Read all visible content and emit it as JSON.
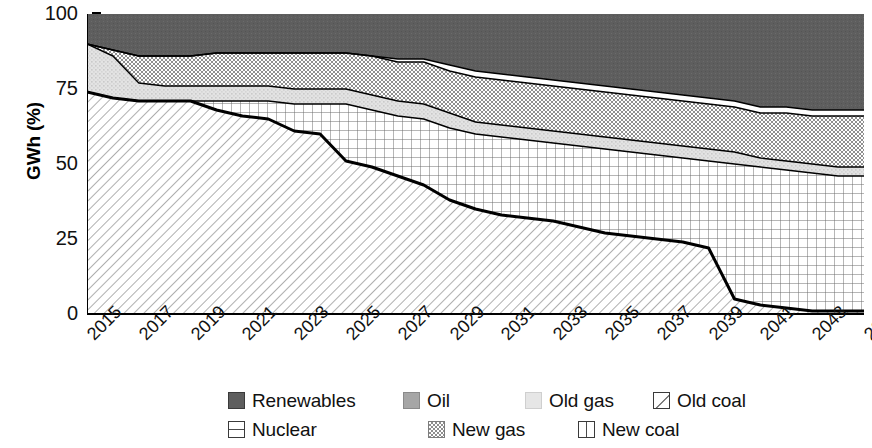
{
  "chart_data": {
    "type": "area",
    "title": "",
    "subtitle": "",
    "xlabel": "",
    "ylabel": "GWh (%)",
    "stacked": true,
    "grid": false,
    "legend_position": "bottom",
    "xlim": [
      2015,
      2045
    ],
    "ylim": [
      0,
      100
    ],
    "yticks": [
      0,
      25,
      50,
      75,
      100
    ],
    "ytick_labels": [
      "0",
      "25",
      "50",
      "75",
      "100"
    ],
    "x": [
      2015,
      2016,
      2017,
      2018,
      2019,
      2020,
      2021,
      2022,
      2023,
      2024,
      2025,
      2026,
      2027,
      2028,
      2029,
      2030,
      2031,
      2032,
      2033,
      2034,
      2035,
      2036,
      2037,
      2038,
      2039,
      2040,
      2041,
      2042,
      2043,
      2044,
      2045
    ],
    "xtick_labels": [
      "2015",
      "2017",
      "2019",
      "2021",
      "2023",
      "2025",
      "2027",
      "2029",
      "2031",
      "2033",
      "2035",
      "2037",
      "2039",
      "2041",
      "2043",
      "2045"
    ],
    "series": [
      {
        "name": "Nuclear",
        "pattern": "diagonal-hatch",
        "color": "#ffffff",
        "values": [
          74,
          72,
          71,
          71,
          71,
          68,
          66,
          65,
          61,
          60,
          51,
          49,
          46,
          43,
          38,
          35,
          33,
          32,
          31,
          29,
          27,
          26,
          25,
          24,
          22,
          5,
          3,
          2,
          1,
          1,
          1
        ]
      },
      {
        "name": "Old coal",
        "pattern": "fine-grid",
        "color": "#ffffff",
        "values": [
          0,
          0,
          0,
          0,
          0,
          3,
          5,
          6,
          9,
          10,
          19,
          19,
          20,
          22,
          24,
          25,
          26,
          26,
          26,
          27,
          28,
          28,
          28,
          28,
          29,
          45,
          46,
          46,
          46,
          45,
          45
        ]
      },
      {
        "name": "Old gas",
        "pattern": "light-stipple",
        "color": "#dcdcdc",
        "values": [
          16,
          14,
          6,
          5,
          5,
          5,
          5,
          5,
          5,
          5,
          5,
          5,
          5,
          5,
          5,
          4,
          4,
          4,
          4,
          4,
          4,
          4,
          4,
          4,
          4,
          4,
          3,
          3,
          3,
          3,
          3
        ]
      },
      {
        "name": "New gas",
        "pattern": "checker",
        "color": "#bdbdbd",
        "values": [
          0,
          2,
          9,
          10,
          10,
          11,
          11,
          11,
          12,
          12,
          12,
          13,
          13,
          14,
          14,
          15,
          15,
          15,
          15,
          15,
          15,
          15,
          15,
          15,
          15,
          15,
          15,
          16,
          16,
          17,
          17
        ]
      },
      {
        "name": "New coal",
        "pattern": "white",
        "color": "#ffffff",
        "values": [
          0,
          0,
          0,
          0,
          0,
          0,
          0,
          0,
          0,
          0,
          0,
          0,
          1,
          1,
          2,
          2,
          2,
          2,
          2,
          2,
          2,
          2,
          2,
          2,
          2,
          2,
          2,
          2,
          2,
          2,
          2
        ]
      },
      {
        "name": "Oil",
        "pattern": "mid-stipple",
        "color": "#9a9a9a",
        "values": [
          0,
          0,
          0,
          0,
          0,
          0,
          0,
          0,
          0,
          0,
          0,
          0,
          0,
          0,
          0,
          0,
          0,
          0,
          0,
          0,
          0,
          0,
          0,
          0,
          0,
          0,
          0,
          0,
          0,
          0,
          0
        ]
      },
      {
        "name": "Renewables",
        "pattern": "dark-solid",
        "color": "#5e5e5e",
        "values": [
          10,
          12,
          14,
          14,
          14,
          13,
          13,
          13,
          13,
          13,
          13,
          14,
          15,
          15,
          17,
          19,
          20,
          21,
          22,
          23,
          24,
          25,
          26,
          27,
          28,
          29,
          31,
          31,
          32,
          32,
          32
        ]
      }
    ],
    "boundaries": {
      "note": "cumulative top edges, percent",
      "nuclear_top": [
        74,
        72,
        71,
        71,
        71,
        68,
        66,
        65,
        61,
        60,
        51,
        49,
        46,
        43,
        38,
        35,
        33,
        32,
        31,
        29,
        27,
        26,
        25,
        24,
        22,
        5,
        3,
        2,
        1,
        1,
        1
      ],
      "oldcoal_top": [
        74,
        72,
        71,
        71,
        71,
        71,
        71,
        71,
        70,
        70,
        70,
        68,
        66,
        65,
        62,
        60,
        59,
        58,
        57,
        56,
        55,
        54,
        53,
        52,
        51,
        50,
        49,
        48,
        47,
        46,
        46
      ],
      "oldgas_top": [
        90,
        86,
        77,
        76,
        76,
        76,
        76,
        76,
        75,
        75,
        75,
        73,
        71,
        70,
        67,
        64,
        63,
        62,
        61,
        60,
        59,
        58,
        57,
        56,
        55,
        54,
        52,
        51,
        50,
        49,
        49
      ],
      "newgas_top": [
        90,
        88,
        86,
        86,
        86,
        87,
        87,
        87,
        87,
        87,
        87,
        86,
        84,
        84,
        81,
        79,
        78,
        77,
        76,
        75,
        74,
        73,
        72,
        71,
        70,
        69,
        67,
        67,
        66,
        66,
        66
      ],
      "newcoal_top": [
        90,
        88,
        86,
        86,
        86,
        87,
        87,
        87,
        87,
        87,
        87,
        86,
        85,
        85,
        83,
        81,
        80,
        79,
        78,
        77,
        76,
        75,
        74,
        73,
        72,
        71,
        69,
        69,
        68,
        68,
        68
      ],
      "renewables_top": [
        100,
        100,
        100,
        100,
        100,
        100,
        100,
        100,
        100,
        100,
        100,
        100,
        100,
        100,
        100,
        100,
        100,
        100,
        100,
        100,
        100,
        100,
        100,
        100,
        100,
        100,
        100,
        100,
        100,
        100,
        100
      ]
    }
  },
  "axis": {
    "y_title": "GWh (%)",
    "y_labels": [
      "100",
      "75",
      "50",
      "25",
      "0"
    ],
    "x_labels": [
      "2015",
      "2017",
      "2019",
      "2021",
      "2023",
      "2025",
      "2027",
      "2029",
      "2031",
      "2033",
      "2035",
      "2037",
      "2039",
      "2041",
      "2043",
      "2045"
    ]
  },
  "legend": {
    "row1": [
      {
        "label": "Renewables",
        "swatch": "dark-solid"
      },
      {
        "label": "Oil",
        "swatch": "mid-stipple"
      },
      {
        "label": "Old gas",
        "swatch": "light-stipple"
      },
      {
        "label": "Old coal",
        "swatch": "diagonal-box"
      }
    ],
    "row2": [
      {
        "label": "Nuclear",
        "swatch": "hline-box"
      },
      {
        "label": "New gas",
        "swatch": "checker"
      },
      {
        "label": "New coal",
        "swatch": "vline-box"
      }
    ]
  },
  "colors": {
    "renewables": "#5e5e5e",
    "oil": "#9a9a9a",
    "old_gas": "#dcdcdc",
    "new_gas": "#bdbdbd",
    "line": "#000000",
    "background": "#ffffff"
  }
}
